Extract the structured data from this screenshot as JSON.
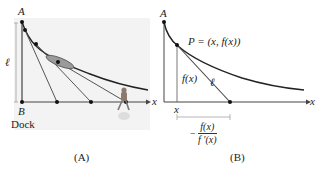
{
  "panelA": {
    "caption": "(A)",
    "labels": {
      "point_top": "A",
      "point_bottom": "B",
      "length": "ℓ",
      "dock": "Dock",
      "axis": "x"
    },
    "colors": {
      "background": "#f2f2f2",
      "curve": "#222222",
      "lines": "#555555"
    }
  },
  "panelB": {
    "caption": "(B)",
    "labels": {
      "point_top": "A",
      "point_p": "P = (x, f(x))",
      "height": "f(x)",
      "length": "ℓ",
      "axis": "x",
      "x_tick": "x",
      "fraction_num": "f(x)",
      "fraction_den": "f ′(x)",
      "fraction_sign": "−"
    }
  }
}
